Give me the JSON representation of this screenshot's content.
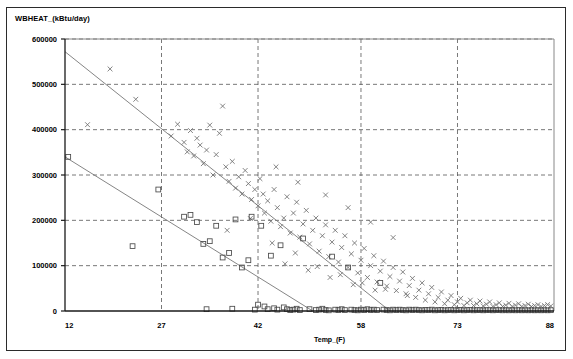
{
  "chart_data": {
    "type": "scatter",
    "title": "WBHEAT_(kBtu/day)",
    "xlabel": "Temp_(F)",
    "ylabel": "WBHEAT_(kBtu/day)",
    "xlim": [
      12,
      88
    ],
    "ylim": [
      0,
      600000
    ],
    "xticks": [
      12,
      27,
      42,
      58,
      73,
      88
    ],
    "yticks": [
      0,
      100000,
      200000,
      300000,
      400000,
      500000,
      600000
    ],
    "xtick_labels": [
      "12",
      "27",
      "42",
      "58",
      "73",
      "88"
    ],
    "ytick_labels": [
      "0",
      "100000",
      "200000",
      "300000",
      "400000",
      "500000",
      "600000"
    ],
    "grid": true,
    "grid_style": "dashed",
    "legend": null,
    "series": [
      {
        "name": "series-x",
        "marker": "x",
        "color": "#6e6e6e",
        "points": [
          [
            15.5,
            411000
          ],
          [
            19.0,
            534000
          ],
          [
            23.0,
            467000
          ],
          [
            28.5,
            386000
          ],
          [
            29.5,
            412000
          ],
          [
            30.5,
            372000
          ],
          [
            31.0,
            351000
          ],
          [
            31.5,
            398000
          ],
          [
            32.0,
            342000
          ],
          [
            32.5,
            381000
          ],
          [
            33.0,
            366000
          ],
          [
            33.5,
            325000
          ],
          [
            34.0,
            355000
          ],
          [
            34.5,
            410000
          ],
          [
            35.0,
            300000
          ],
          [
            35.5,
            345000
          ],
          [
            36.0,
            392000
          ],
          [
            36.5,
            452000
          ],
          [
            37.0,
            318000
          ],
          [
            37.5,
            286000
          ],
          [
            38.0,
            330000
          ],
          [
            38.5,
            271000
          ],
          [
            39.0,
            296000
          ],
          [
            39.5,
            258000
          ],
          [
            40.0,
            310000
          ],
          [
            40.5,
            281000
          ],
          [
            41.0,
            246000
          ],
          [
            41.5,
            268000
          ],
          [
            42.0,
            232000
          ],
          [
            42.3,
            292000
          ],
          [
            42.8,
            258000
          ],
          [
            43.0,
            216000
          ],
          [
            43.5,
            243000
          ],
          [
            44.0,
            198000
          ],
          [
            44.5,
            268000
          ],
          [
            45.0,
            228000
          ],
          [
            45.5,
            186000
          ],
          [
            46.0,
            205000
          ],
          [
            46.5,
            252000
          ],
          [
            47.0,
            172000
          ],
          [
            47.5,
            216000
          ],
          [
            48.0,
            240000
          ],
          [
            48.5,
            163000
          ],
          [
            49.0,
            192000
          ],
          [
            49.5,
            222000
          ],
          [
            50.0,
            148000
          ],
          [
            50.5,
            178000
          ],
          [
            51.0,
            205000
          ],
          [
            51.5,
            132000
          ],
          [
            52.0,
            166000
          ],
          [
            52.5,
            190000
          ],
          [
            53.0,
            120000
          ],
          [
            53.5,
            152000
          ],
          [
            54.0,
            178000
          ],
          [
            54.5,
            108000
          ],
          [
            55.0,
            140000
          ],
          [
            55.5,
            166000
          ],
          [
            56.0,
            96000
          ],
          [
            56.5,
            126000
          ],
          [
            57.0,
            150000
          ],
          [
            57.5,
            84000
          ],
          [
            58.0,
            112000
          ],
          [
            58.5,
            138000
          ],
          [
            59.0,
            74000
          ],
          [
            59.5,
            100000
          ],
          [
            60.0,
            122000
          ],
          [
            60.5,
            64000
          ],
          [
            61.0,
            88000
          ],
          [
            61.5,
            110000
          ],
          [
            62.0,
            55000
          ],
          [
            62.5,
            76000
          ],
          [
            63.0,
            96000
          ],
          [
            63.5,
            45000
          ],
          [
            64.0,
            66000
          ],
          [
            64.5,
            86000
          ],
          [
            65.0,
            38000
          ],
          [
            65.5,
            56000
          ],
          [
            66.0,
            72000
          ],
          [
            66.5,
            30000
          ],
          [
            67.0,
            46000
          ],
          [
            67.5,
            62000
          ],
          [
            68.0,
            24000
          ],
          [
            68.5,
            38000
          ],
          [
            69.0,
            52000
          ],
          [
            69.5,
            20000
          ],
          [
            70.0,
            30000
          ],
          [
            70.5,
            42000
          ],
          [
            71.0,
            16000
          ],
          [
            71.5,
            24000
          ],
          [
            72.0,
            34000
          ],
          [
            72.5,
            14000
          ],
          [
            73.0,
            20000
          ],
          [
            73.5,
            28000
          ],
          [
            74.0,
            12000
          ],
          [
            74.5,
            18000
          ],
          [
            75.0,
            24000
          ],
          [
            75.5,
            12000
          ],
          [
            76.0,
            16000
          ],
          [
            76.5,
            22000
          ],
          [
            77.0,
            11000
          ],
          [
            77.5,
            15000
          ],
          [
            78.0,
            20000
          ],
          [
            78.5,
            10000
          ],
          [
            79.0,
            14000
          ],
          [
            79.5,
            18000
          ],
          [
            80.0,
            10000
          ],
          [
            80.5,
            13000
          ],
          [
            81.0,
            17000
          ],
          [
            81.5,
            10000
          ],
          [
            82.0,
            13000
          ],
          [
            82.5,
            16000
          ],
          [
            83.0,
            10000
          ],
          [
            83.5,
            12000
          ],
          [
            84.0,
            15000
          ],
          [
            84.5,
            10000
          ],
          [
            85.0,
            12000
          ],
          [
            85.5,
            14000
          ],
          [
            86.0,
            10000
          ],
          [
            86.5,
            12000
          ],
          [
            87.0,
            14000
          ],
          [
            87.5,
            11000
          ],
          [
            37.2,
            178000
          ],
          [
            40.8,
            204000
          ],
          [
            44.2,
            150000
          ],
          [
            47.8,
            128000
          ],
          [
            51.2,
            98000
          ],
          [
            54.8,
            80000
          ],
          [
            58.2,
            62000
          ],
          [
            61.8,
            48000
          ],
          [
            65.2,
            34000
          ],
          [
            44.8,
            318000
          ],
          [
            48.2,
            284000
          ],
          [
            52.5,
            256000
          ],
          [
            56.0,
            228000
          ],
          [
            59.5,
            196000
          ],
          [
            63.0,
            162000
          ],
          [
            46.2,
            104000
          ],
          [
            49.8,
            90000
          ],
          [
            53.2,
            74000
          ],
          [
            56.8,
            58000
          ],
          [
            60.2,
            46000
          ]
        ]
      },
      {
        "name": "series-square",
        "marker": "square",
        "color": "#4a4a4a",
        "points": [
          [
            12.5,
            340000
          ],
          [
            22.5,
            143000
          ],
          [
            26.5,
            268000
          ],
          [
            30.5,
            208000
          ],
          [
            31.5,
            212000
          ],
          [
            32.5,
            196000
          ],
          [
            33.5,
            148000
          ],
          [
            34.5,
            154000
          ],
          [
            35.5,
            188000
          ],
          [
            36.5,
            118000
          ],
          [
            37.5,
            128000
          ],
          [
            38.5,
            202000
          ],
          [
            39.5,
            96000
          ],
          [
            40.5,
            112000
          ],
          [
            41.5,
            3000
          ],
          [
            42.0,
            14000
          ],
          [
            42.5,
            188000
          ],
          [
            43.0,
            10000
          ],
          [
            43.5,
            4000
          ],
          [
            44.0,
            122000
          ],
          [
            44.5,
            6000
          ],
          [
            45.0,
            3000
          ],
          [
            45.5,
            145000
          ],
          [
            46.0,
            8000
          ],
          [
            46.5,
            4000
          ],
          [
            47.0,
            2000
          ],
          [
            47.5,
            3000
          ],
          [
            48.0,
            5000
          ],
          [
            48.5,
            2000
          ],
          [
            49.0,
            160000
          ],
          [
            50.0,
            4000
          ],
          [
            51.0,
            2000
          ],
          [
            51.5,
            3000
          ],
          [
            52.0,
            5000
          ],
          [
            52.5,
            2000
          ],
          [
            53.0,
            1500
          ],
          [
            53.5,
            120000
          ],
          [
            54.0,
            3000
          ],
          [
            54.5,
            2000
          ],
          [
            55.0,
            4000
          ],
          [
            55.5,
            2000
          ],
          [
            56.0,
            96000
          ],
          [
            56.5,
            3000
          ],
          [
            57.0,
            2000
          ],
          [
            57.5,
            1500
          ],
          [
            58.0,
            3000
          ],
          [
            58.5,
            2000
          ],
          [
            59.0,
            4000
          ],
          [
            59.5,
            2000
          ],
          [
            60.0,
            3000
          ],
          [
            60.5,
            2000
          ],
          [
            61.0,
            62000
          ],
          [
            61.5,
            3000
          ],
          [
            62.0,
            2000
          ],
          [
            62.5,
            1500
          ],
          [
            63.0,
            3000
          ],
          [
            63.5,
            2000
          ],
          [
            64.0,
            3000
          ],
          [
            64.5,
            2000
          ],
          [
            65.0,
            1500
          ],
          [
            65.5,
            3000
          ],
          [
            66.0,
            2000
          ],
          [
            66.5,
            3000
          ],
          [
            67.0,
            2000
          ],
          [
            67.5,
            1500
          ],
          [
            68.0,
            2500
          ],
          [
            68.5,
            2000
          ],
          [
            69.0,
            3000
          ],
          [
            69.5,
            1500
          ],
          [
            70.0,
            2000
          ],
          [
            70.5,
            2500
          ],
          [
            71.0,
            1500
          ],
          [
            71.5,
            2000
          ],
          [
            72.0,
            2500
          ],
          [
            72.5,
            1500
          ],
          [
            73.0,
            2000
          ],
          [
            73.5,
            2500
          ],
          [
            74.0,
            1500
          ],
          [
            74.5,
            2000
          ],
          [
            75.0,
            2500
          ],
          [
            75.5,
            1500
          ],
          [
            76.0,
            2000
          ],
          [
            76.5,
            2000
          ],
          [
            77.0,
            1500
          ],
          [
            77.5,
            2000
          ],
          [
            78.0,
            2000
          ],
          [
            78.5,
            1500
          ],
          [
            79.0,
            2000
          ],
          [
            79.5,
            2000
          ],
          [
            80.0,
            1500
          ],
          [
            80.5,
            2000
          ],
          [
            81.0,
            1500
          ],
          [
            81.5,
            2000
          ],
          [
            82.0,
            1500
          ],
          [
            82.5,
            2000
          ],
          [
            83.0,
            1500
          ],
          [
            83.5,
            1800
          ],
          [
            84.0,
            1500
          ],
          [
            84.5,
            1800
          ],
          [
            85.0,
            1500
          ],
          [
            85.5,
            1800
          ],
          [
            86.0,
            1500
          ],
          [
            86.5,
            1800
          ],
          [
            87.0,
            1500
          ],
          [
            87.5,
            1800
          ],
          [
            34.0,
            4000
          ],
          [
            38.0,
            5000
          ],
          [
            41.0,
            208000
          ]
        ]
      }
    ],
    "fit_lines": [
      {
        "name": "fit-upper",
        "x1": 12,
        "y1": 572000,
        "x2": 62.5,
        "y2": 0,
        "color": "#777777"
      },
      {
        "name": "fit-lower",
        "x1": 12,
        "y1": 340000,
        "x2": 50.5,
        "y2": 0,
        "color": "#777777"
      }
    ]
  }
}
